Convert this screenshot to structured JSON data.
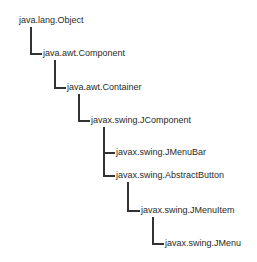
{
  "diagram": {
    "type": "class-hierarchy-tree",
    "nodes": [
      {
        "id": "object",
        "label": "java.lang.Object",
        "parent": null
      },
      {
        "id": "component",
        "label": "java.awt.Component",
        "parent": "object"
      },
      {
        "id": "container",
        "label": "java.awt.Container",
        "parent": "component"
      },
      {
        "id": "jcomponent",
        "label": "javax.swing.JComponent",
        "parent": "container"
      },
      {
        "id": "jmenubar",
        "label": "javax.swing.JMenuBar",
        "parent": "jcomponent"
      },
      {
        "id": "abstractbutton",
        "label": "javax.swing.AbstractButton",
        "parent": "jcomponent"
      },
      {
        "id": "jmenuitem",
        "label": "javax.swing.JMenuItem",
        "parent": "abstractbutton"
      },
      {
        "id": "jmenu",
        "label": "javax.swing.JMenu",
        "parent": "jmenuitem"
      }
    ]
  }
}
